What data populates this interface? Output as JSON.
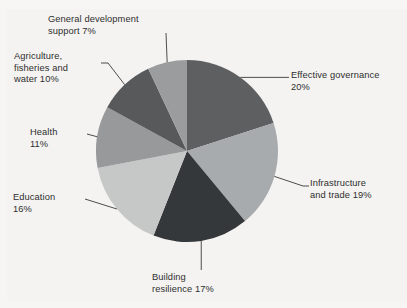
{
  "chart_data": {
    "type": "pie",
    "title": "",
    "subtitle": "",
    "xlabel": "",
    "ylabel": "",
    "legend_position": "callout-labels",
    "grid": false,
    "units": "percent",
    "total": 100,
    "start_angle_deg": 0,
    "direction": "clockwise",
    "categories": [
      "Effective governance",
      "Infrastructure and trade",
      "Building resilience",
      "Education",
      "Health",
      "Agriculture, fisheries and water",
      "General development support"
    ],
    "values": [
      20,
      19,
      17,
      16,
      11,
      10,
      7
    ],
    "colors": [
      "#5e5f61",
      "#a8abad",
      "#35383b",
      "#c6c7c7",
      "#97999b",
      "#58595b",
      "#9a9c9d"
    ],
    "slices": [
      {
        "name": "effective-governance",
        "label": "Effective governance",
        "value": 20,
        "percent_text": "20%",
        "color": "#5e5f61",
        "callout_text": "Effective governance\n20%"
      },
      {
        "name": "infrastructure-and-trade",
        "label": "Infrastructure and trade",
        "value": 19,
        "percent_text": "19%",
        "color": "#a8abad",
        "callout_text": "Infrastructure\nand trade 19%"
      },
      {
        "name": "building-resilience",
        "label": "Building resilience",
        "value": 17,
        "percent_text": "17%",
        "color": "#35383b",
        "callout_text": "Building\nresilience 17%"
      },
      {
        "name": "education",
        "label": "Education",
        "value": 16,
        "percent_text": "16%",
        "color": "#c6c7c7",
        "callout_text": "Education\n16%"
      },
      {
        "name": "health",
        "label": "Health",
        "value": 11,
        "percent_text": "11%",
        "color": "#97999b",
        "callout_text": "Health\n11%"
      },
      {
        "name": "agriculture-fisheries-water",
        "label": "Agriculture, fisheries and water",
        "value": 10,
        "percent_text": "10%",
        "color": "#58595b",
        "callout_text": "Agriculture,\nfisheries and\nwater 10%"
      },
      {
        "name": "general-development-support",
        "label": "General development support",
        "value": 7,
        "percent_text": "7%",
        "color": "#9a9c9d",
        "callout_text": "General development\nsupport 7%"
      }
    ]
  },
  "style": {
    "background": "#f4f3f1",
    "text_color": "#2e2e2e",
    "leader_line_color": "#3a3a3a"
  },
  "geometry": {
    "center_x": 187,
    "center_y": 151,
    "radius": 91
  }
}
